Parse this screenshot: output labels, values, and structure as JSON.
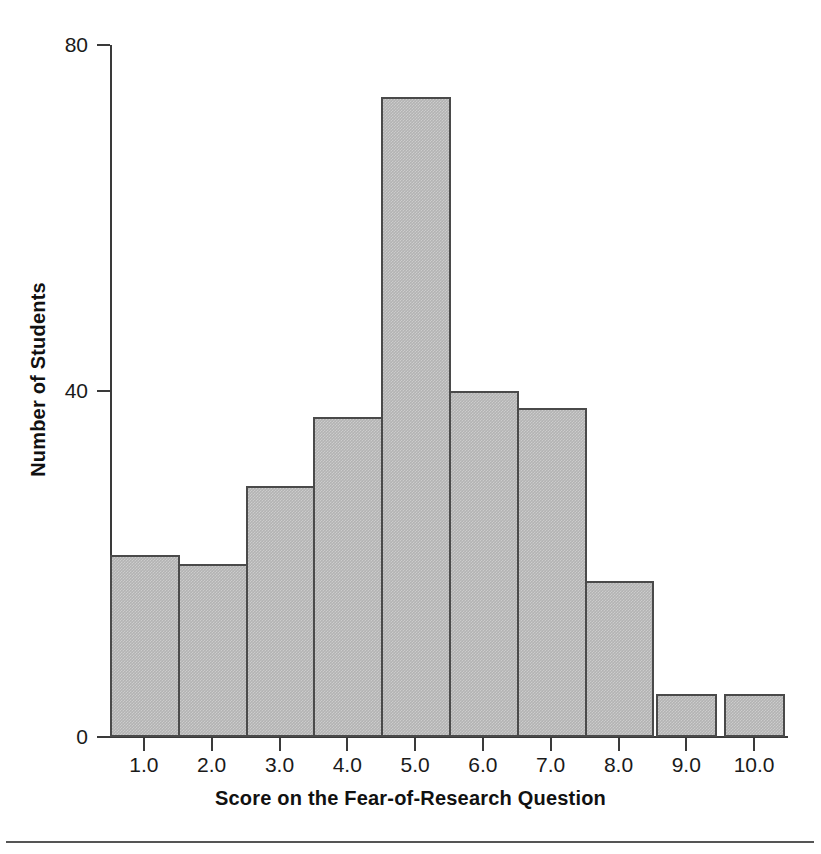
{
  "chart_data": {
    "type": "bar",
    "title": "",
    "subtitle": "",
    "xlabel": "Score on the Fear-of-Research Question",
    "ylabel": "Number of Students",
    "categories": [
      "1.0",
      "2.0",
      "3.0",
      "4.0",
      "5.0",
      "6.0",
      "7.0",
      "8.0",
      "9.0",
      "10.0"
    ],
    "values": [
      21,
      20,
      29,
      37,
      74,
      40,
      38,
      18,
      5,
      5
    ],
    "xlim": [
      0.5,
      10.5
    ],
    "ylim": [
      0,
      80
    ],
    "ytick_labels": [
      "0",
      "40",
      "80"
    ],
    "ytick_values": [
      0,
      40,
      80
    ],
    "xtick_labels": [
      "1.0",
      "2.0",
      "3.0",
      "4.0",
      "5.0",
      "6.0",
      "7.0",
      "8.0",
      "9.0",
      "10.0"
    ],
    "grid": false,
    "legend": null,
    "legend_position": "none",
    "bar_fill_color": "#b3b3b3",
    "bar_edge_color": "#4a4a4a",
    "axis_color": "#3a3a3a",
    "background_color": "#ffffff",
    "annotations": []
  },
  "figure": {
    "bottom_rule_color": "#555555"
  }
}
